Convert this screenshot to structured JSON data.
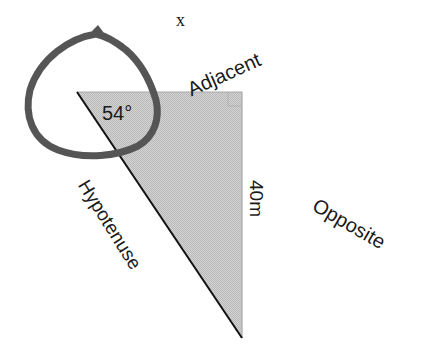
{
  "diagram": {
    "type": "right-triangle-trigonometry",
    "labels": {
      "unknown": "x",
      "adjacent": "Adjacent",
      "angle": "54°",
      "side_length": "40m",
      "opposite": "Opposite",
      "hypotenuse": "Hypotenuse"
    },
    "triangle": {
      "vertices": {
        "angle_vertex": [
          77,
          92
        ],
        "right_angle_vertex": [
          242,
          92
        ],
        "bottom_vertex": [
          242,
          338
        ]
      },
      "fill": "#c9c9c9",
      "stroke": "#1a1a1a"
    },
    "angle_marker": {
      "description": "hand-drawn loop around the 54° angle with arrow at top",
      "stroke": "#555555"
    }
  }
}
